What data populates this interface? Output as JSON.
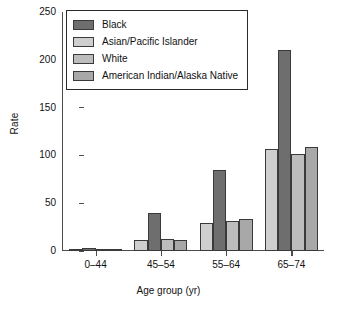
{
  "chart_data": {
    "type": "bar",
    "title": "",
    "xlabel": "Age group (yr)",
    "ylabel": "Rate",
    "categories": [
      "0–44",
      "45–54",
      "55–64",
      "65–74"
    ],
    "ylim": [
      0,
      250
    ],
    "yticks": [
      0,
      50,
      100,
      150,
      200,
      250
    ],
    "grid": false,
    "legend_position": "top-left",
    "series": [
      {
        "name": "Black",
        "color": "#6e6e6e",
        "swatch_class": "swatch-black",
        "values": [
          3,
          40,
          85,
          210
        ]
      },
      {
        "name": "Asian/Pacific Islander",
        "color": "#cfcfcf",
        "swatch_class": "swatch-asian",
        "values": [
          2,
          11,
          29,
          107
        ]
      },
      {
        "name": "White",
        "color": "#bdbdbd",
        "swatch_class": "swatch-white",
        "values": [
          1,
          13,
          31,
          101
        ]
      },
      {
        "name": "American Indian/Alaska Native",
        "color": "#a8a8a8",
        "swatch_class": "swatch-aian",
        "values": [
          2,
          12,
          33,
          109
        ]
      }
    ],
    "bar_draw_order": [
      "Asian/Pacific Islander",
      "Black",
      "White",
      "American Indian/Alaska Native"
    ]
  }
}
